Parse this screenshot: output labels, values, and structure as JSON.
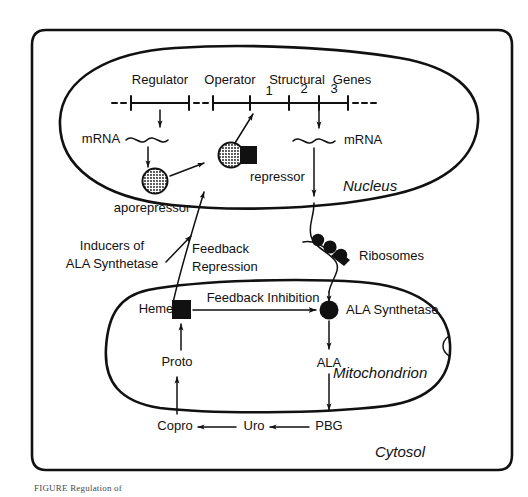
{
  "figure": {
    "caption": "FIGURE  Regulation of",
    "background_color": "#ffffff",
    "ink_color": "#111111"
  },
  "compartments": {
    "cell": {
      "label": "",
      "name": "cell-boundary"
    },
    "nucleus": {
      "label": "Nucleus"
    },
    "mitochondrion": {
      "label": "Mitochondrion"
    },
    "cytosol": {
      "label": "Cytosol"
    }
  },
  "gene_map": {
    "segments": [
      {
        "label": "Regulator"
      },
      {
        "label": "Operator"
      },
      {
        "label": "Structural"
      },
      {
        "label": "Genes"
      }
    ],
    "structural_gene_numbers": [
      "1",
      "2",
      "3"
    ]
  },
  "transcripts": {
    "regulator_mrna": "mRNA",
    "structural_mrna": "mRNA"
  },
  "molecules": {
    "aporepressor": "aporepressor",
    "repressor": "repressor",
    "ribosomes": "Ribosomes",
    "heme": "Heme",
    "ala_synthetase": "ALA Synthetase",
    "proto": "Proto",
    "copro": "Copro",
    "uro": "Uro",
    "pbg": "PBG",
    "ala": "ALA"
  },
  "annotations": {
    "inducers_line1": "Inducers of",
    "inducers_line2": "ALA Synthetase",
    "feedback_repression_line1": "Feedback",
    "feedback_repression_line2": "Repression",
    "feedback_inhibition": "Feedback Inhibition"
  },
  "icons": {
    "aporepressor_icon": "hatched-circle-icon",
    "repressor_icon": "hatched-circle-with-black-square-icon",
    "heme_icon": "black-square-icon",
    "ala_synthetase_icon": "black-circle-icon",
    "ribosome_icon": "black-dot-icon",
    "mrna_icon": "wavy-line-icon",
    "arrow_icon": "arrowhead-icon"
  }
}
